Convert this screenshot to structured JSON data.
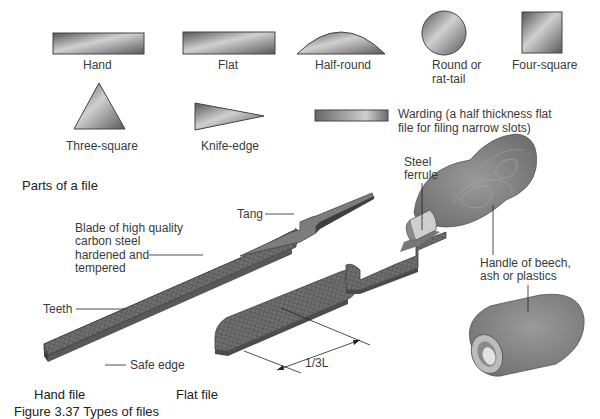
{
  "diagram": {
    "shapes": [
      {
        "label": "Hand"
      },
      {
        "label": "Flat"
      },
      {
        "label": "Half-round"
      },
      {
        "label_line1": "Round or",
        "label_line2": "rat-tail"
      },
      {
        "label": "Four-square"
      },
      {
        "label": "Three-square"
      },
      {
        "label": "Knife-edge"
      },
      {
        "label_line1": "Warding (a half thickness flat",
        "label_line2": "file for filing narrow slots)"
      }
    ],
    "parts_title": "Parts of a file",
    "parts": {
      "tang": "Tang",
      "blade_line1": "Blade of high quality",
      "blade_line2": "carbon steel",
      "blade_line3": "hardened and",
      "blade_line4": "tempered",
      "teeth": "Teeth",
      "safe_edge": "Safe edge",
      "ferrule_line1": "Steel",
      "ferrule_line2": "ferrule",
      "handle_line1": "Handle of beech,",
      "handle_line2": "ash or plastics",
      "dimension": "1/3L"
    },
    "file_types": {
      "hand_file": "Hand file",
      "flat_file": "Flat file"
    },
    "caption": "Figure 3.37 Types of files",
    "colors": {
      "steel_dark": "#5a5a5a",
      "steel_light": "#c8c8c8",
      "handle": "#8a8a8a",
      "text": "#3a3a3a"
    }
  }
}
